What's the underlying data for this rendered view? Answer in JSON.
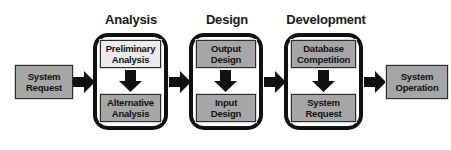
{
  "diagram": {
    "colors": {
      "box_fill_light": "#ebebeb",
      "box_fill_mid": "#a6a6a6",
      "outline": "#111111",
      "arrow": "#111111",
      "background": "#ffffff",
      "text": "#111111"
    },
    "section_titles": [
      {
        "label": "Analysis"
      },
      {
        "label": "Design"
      },
      {
        "label": "Development"
      }
    ],
    "start_node": {
      "line1": "System",
      "line2": "Request"
    },
    "end_node": {
      "line1": "System",
      "line2": "Operation"
    },
    "phases": [
      {
        "name": "Analysis",
        "steps": [
          {
            "line1": "Preliminary",
            "line2": "Analysis",
            "shade": "light"
          },
          {
            "line1": "Alternative",
            "line2": "Analysis",
            "shade": "mid"
          }
        ]
      },
      {
        "name": "Design",
        "steps": [
          {
            "line1": "Output",
            "line2": "Design",
            "shade": "mid"
          },
          {
            "line1": "Input",
            "line2": "Design",
            "shade": "mid"
          }
        ]
      },
      {
        "name": "Development",
        "steps": [
          {
            "line1": "Database",
            "line2": "Competition",
            "shade": "mid"
          },
          {
            "line1": "System",
            "line2": "Request",
            "shade": "mid"
          }
        ]
      }
    ],
    "connector_arrows": [
      {
        "name": "start-to-analysis",
        "direction": "right"
      },
      {
        "name": "analysis-to-design",
        "direction": "right"
      },
      {
        "name": "design-to-development",
        "direction": "right"
      },
      {
        "name": "development-to-end",
        "direction": "right"
      }
    ],
    "internal_arrows": [
      {
        "name": "analysis-internal",
        "direction": "down"
      },
      {
        "name": "design-internal",
        "direction": "down"
      },
      {
        "name": "development-internal",
        "direction": "down"
      }
    ]
  }
}
